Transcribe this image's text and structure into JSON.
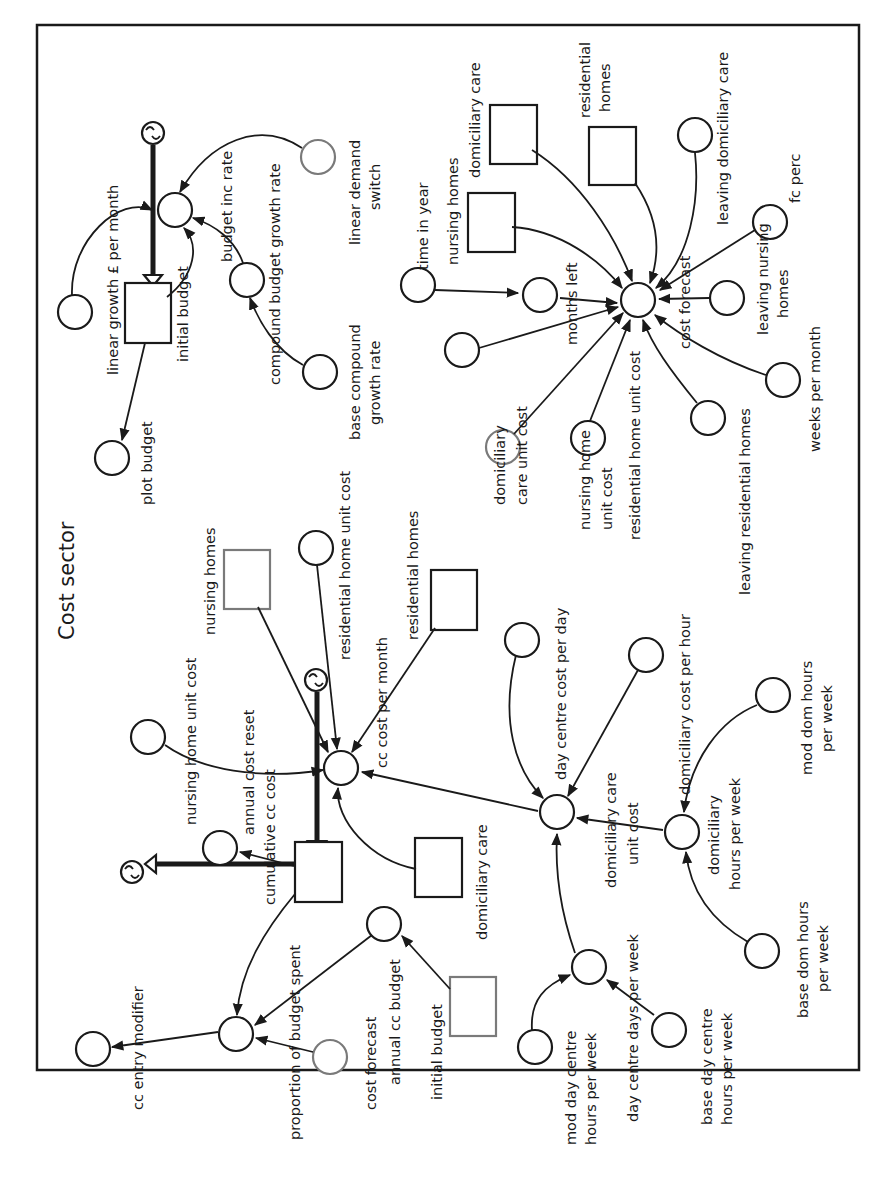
{
  "diagram": {
    "title": "Cost sector",
    "orientation": "rotated 90° clockwise",
    "stocks": {
      "initial_budget_top": "initial budget",
      "cumulative_cc_cost": "cumulative cc cost",
      "nursing_homes_ghost": "nursing homes",
      "residential_homes_ghost": "residential homes",
      "domiciliary_care_ghost": "domiciliary care",
      "initial_budget_ghost": "initial budget",
      "nursing_homes_right": "nursing homes",
      "domiciliary_care_right": "domiciliary care",
      "residential_homes_right_1": "residential",
      "residential_homes_right_2": "homes"
    },
    "flows": {
      "budget_inc_rate": "budget inc rate",
      "cc_cost_per_month": "cc cost per month",
      "annual_cost_reset": "annual cost reset"
    },
    "variables": {
      "linear_growth": "linear growth £ per month",
      "plot_budget": "plot budget",
      "compound_budget_growth_rate": "compound budget growth rate",
      "base_compound_1": "base compound",
      "base_compound_2": "growth rate",
      "linear_demand_switch_1": "linear demand",
      "linear_demand_switch_2": "switch",
      "time_in_year": "time in year",
      "months_left": "months left",
      "cost_forecast": "cost forecast",
      "leaving_domiciliary_care": "leaving domiciliary care",
      "fc_perc": "fc perc",
      "leaving_nursing_homes_1": "leaving nursing",
      "leaving_nursing_homes_2": "homes",
      "weeks_per_month": "weeks per month",
      "leaving_residential_homes": "leaving residential homes",
      "residential_home_unit_cost_right": "residential home unit cost",
      "nursing_home_unit_cost_right_1": "nursing home",
      "nursing_home_unit_cost_right_2": "unit cost",
      "domiciliary_care_unit_cost_right_1": "domiciliary",
      "domiciliary_care_unit_cost_right_2": "care unit cost",
      "nursing_home_unit_cost_left": "nursing home unit cost",
      "residential_home_unit_cost_left": "residential home unit cost",
      "day_centre_cost_per_day": "day centre cost per day",
      "domiciliary_cost_per_hour": "domiciliary cost per hour",
      "domiciliary_care_unit_cost_1": "domiciliary care",
      "domiciliary_care_unit_cost_2": "unit cost",
      "domiciliary_hours_per_week_1": "domiciliary",
      "domiciliary_hours_per_week_2": "hours per week",
      "mod_dom_hours_1": "mod dom hours",
      "mod_dom_hours_2": "per week",
      "base_dom_hours_1": "base dom hours",
      "base_dom_hours_2": "per week",
      "day_centre_days_per_week": "day centre days per week",
      "mod_day_centre_1": "mod day centre",
      "mod_day_centre_2": "hours per week",
      "base_day_centre_1": "base day centre",
      "base_day_centre_2": "hours per week",
      "proportion_of_budget_spent": "proportion of budget spent",
      "cc_entry_modifier": "cc entry modifier",
      "cost_forecast_ghost": "cost forecast",
      "annual_cc_budget": "annual cc budget"
    }
  }
}
